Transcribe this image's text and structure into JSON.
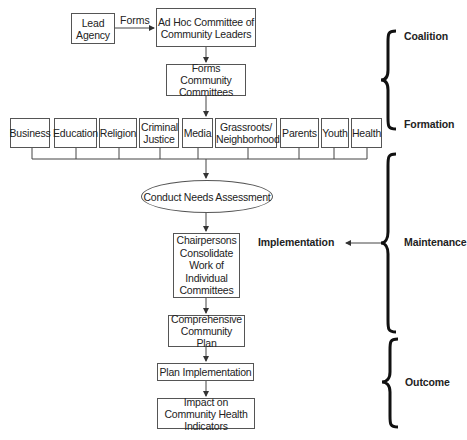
{
  "flowchart": {
    "lead_agency": "Lead Agency",
    "forms_edge_label": "Forms",
    "ad_hoc": "Ad Hoc Committee of Community Leaders",
    "forms_committees": "Forms Community Committees",
    "committees": [
      {
        "label": "Business"
      },
      {
        "label": "Education"
      },
      {
        "label": "Religion"
      },
      {
        "label": "Criminal Justice"
      },
      {
        "label": "Media"
      },
      {
        "label": "Grassroots/ Neighborhood"
      },
      {
        "label": "Parents"
      },
      {
        "label": "Youth"
      },
      {
        "label": "Health"
      }
    ],
    "needs_assessment": "Conduct Needs Assessment",
    "chairpersons": "Chairpersons Consolidate Work of Individual Committees",
    "comprehensive_plan": "Comprehensive Community Plan",
    "plan_implementation": "Plan Implementation",
    "impact": "Impact on Community Health Indicators"
  },
  "phases": {
    "coalition": "Coalition",
    "formation": "Formation",
    "maintenance": "Maintenance",
    "implementation": "Implementation",
    "outcome": "Outcome"
  },
  "colors": {
    "line": "#444444",
    "brace": "#111111",
    "text": "#222222"
  }
}
